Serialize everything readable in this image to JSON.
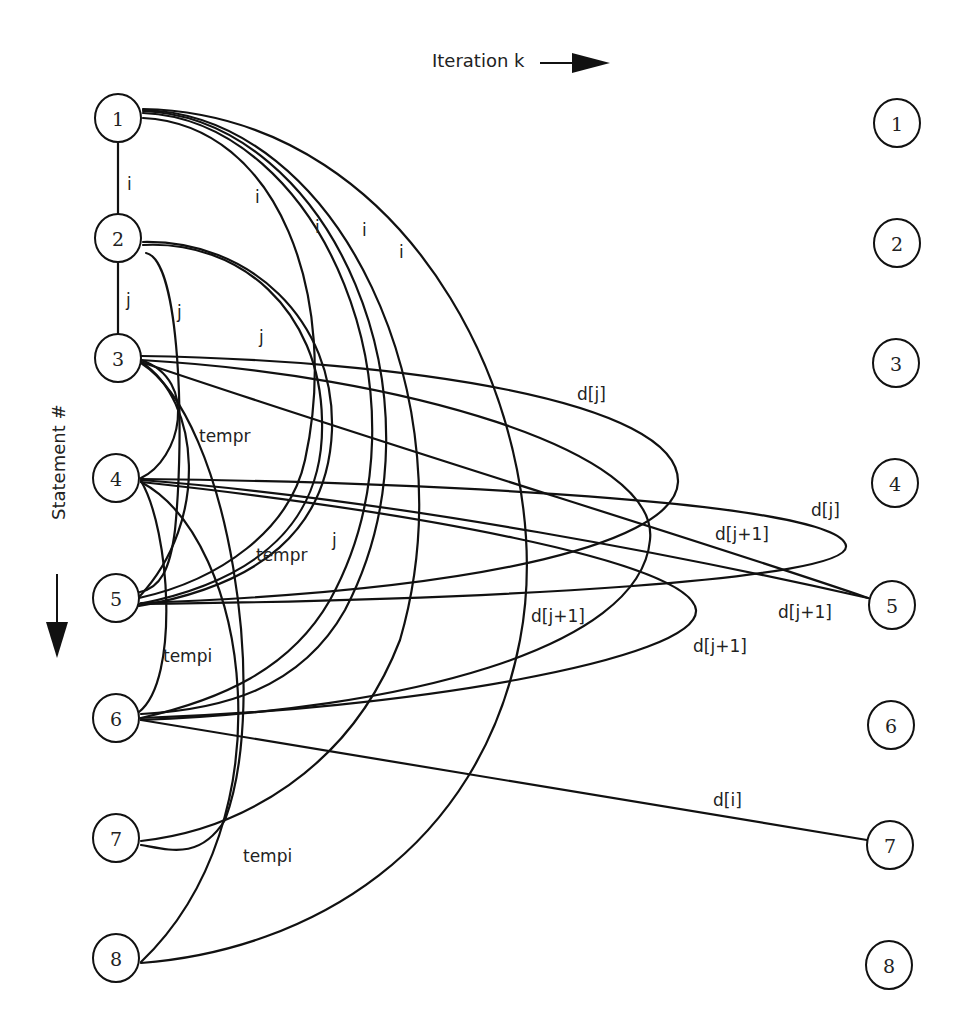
{
  "diagram": {
    "type": "dependence-graph",
    "x_axis": {
      "label": "Iteration k",
      "arrow": "arrow-right-icon"
    },
    "y_axis": {
      "label": "Statement #",
      "arrow": "arrow-down-icon"
    },
    "left_nodes": [
      {
        "id": "L1",
        "label": "1",
        "x": 118,
        "y": 118
      },
      {
        "id": "L2",
        "label": "2",
        "x": 118,
        "y": 238
      },
      {
        "id": "L3",
        "label": "3",
        "x": 118,
        "y": 358
      },
      {
        "id": "L4",
        "label": "4",
        "x": 116,
        "y": 478
      },
      {
        "id": "L5",
        "label": "5",
        "x": 116,
        "y": 598
      },
      {
        "id": "L6",
        "label": "6",
        "x": 116,
        "y": 718
      },
      {
        "id": "L7",
        "label": "7",
        "x": 116,
        "y": 838
      },
      {
        "id": "L8",
        "label": "8",
        "x": 116,
        "y": 958
      }
    ],
    "right_nodes": [
      {
        "id": "R1",
        "label": "1",
        "x": 897,
        "y": 123
      },
      {
        "id": "R2",
        "label": "2",
        "x": 897,
        "y": 243
      },
      {
        "id": "R3",
        "label": "3",
        "x": 896,
        "y": 363
      },
      {
        "id": "R4",
        "label": "4",
        "x": 895,
        "y": 483
      },
      {
        "id": "R5",
        "label": "5",
        "x": 892,
        "y": 605
      },
      {
        "id": "R6",
        "label": "6",
        "x": 891,
        "y": 725
      },
      {
        "id": "R7",
        "label": "7",
        "x": 890,
        "y": 845
      },
      {
        "id": "R8",
        "label": "8",
        "x": 889,
        "y": 965
      }
    ],
    "edge_labels": [
      {
        "text": "i",
        "x": 127,
        "y": 190
      },
      {
        "text": "i",
        "x": 255,
        "y": 203
      },
      {
        "text": "i",
        "x": 315,
        "y": 233
      },
      {
        "text": "i",
        "x": 362,
        "y": 236
      },
      {
        "text": "i",
        "x": 399,
        "y": 258
      },
      {
        "text": "j",
        "x": 126,
        "y": 306
      },
      {
        "text": "j",
        "x": 177,
        "y": 318
      },
      {
        "text": "j",
        "x": 259,
        "y": 343
      },
      {
        "text": "tempr",
        "x": 199,
        "y": 442
      },
      {
        "text": "tempr",
        "x": 256,
        "y": 561
      },
      {
        "text": "j",
        "x": 332,
        "y": 546
      },
      {
        "text": "tempi",
        "x": 163,
        "y": 662
      },
      {
        "text": "tempi",
        "x": 243,
        "y": 862
      },
      {
        "text": "d[j]",
        "x": 577,
        "y": 400
      },
      {
        "text": "d[j]",
        "x": 811,
        "y": 516
      },
      {
        "text": "d[j+1]",
        "x": 715,
        "y": 540
      },
      {
        "text": "d[j+1]",
        "x": 531,
        "y": 622
      },
      {
        "text": "d[j+1]",
        "x": 778,
        "y": 618
      },
      {
        "text": "d[j+1]",
        "x": 693,
        "y": 652
      },
      {
        "text": "d[i]",
        "x": 713,
        "y": 806
      }
    ],
    "edges": [
      {
        "from": "L1",
        "to": "L2",
        "label": "i",
        "d": "M118 141 L118 215"
      },
      {
        "from": "L2",
        "to": "L3",
        "label": "j",
        "d": "M118 261 L118 335"
      },
      {
        "from": "L1",
        "to": "L5",
        "label": "i",
        "d": "M143 118 C 280 125, 340 300, 305 460 C 290 530, 220 580, 139 598"
      },
      {
        "from": "L1",
        "to": "L6",
        "label": "i",
        "d": "M143 113 C 320 120, 440 400, 330 600 C 290 670, 220 700, 141 718"
      },
      {
        "from": "L1",
        "to": "L6b",
        "label": "i",
        "d": "M143 111 C 330 118, 455 400, 345 610 C 300 690, 220 710, 141 714"
      },
      {
        "from": "L1",
        "to": "L7",
        "label": "i",
        "d": "M143 110 C 340 115, 470 400, 400 640 C 350 770, 240 830, 141 841"
      },
      {
        "from": "L1",
        "to": "L8",
        "label": "i",
        "d": "M143 109 C 420 115, 560 430, 520 640 C 480 850, 310 950, 141 963"
      },
      {
        "from": "L2",
        "to": "L5",
        "label": "j",
        "d": "M143 245 C 240 240, 320 310, 322 420 C 325 520, 260 580, 139 604"
      },
      {
        "from": "L2",
        "to": "L5b",
        "label": "j",
        "d": "M143 242 C 250 240, 335 320, 332 430 C 328 530, 260 585, 139 606"
      },
      {
        "from": "L2",
        "to": "L5c",
        "label": "j",
        "d": "M146 253 C 180 260, 185 430, 175 530 C 170 570, 160 588, 140 592"
      },
      {
        "from": "L3",
        "to": "L4",
        "label": "tempr",
        "d": "M141 360 C 200 380, 180 460, 141 478"
      },
      {
        "from": "L3",
        "to": "L5",
        "label": "tempr",
        "d": "M141 362 C 200 400, 210 520, 140 596"
      },
      {
        "from": "L3",
        "to": "L7",
        "label": "tempr",
        "d": "M141 363 C 230 420, 270 700, 225 820 C 200 860, 170 850, 141 845"
      },
      {
        "from": "L3",
        "to": "R5",
        "label": "d[j+1]",
        "d": "M141 362 C 400 450, 700 540, 868 598"
      },
      {
        "from": "L3",
        "to": "R4loop",
        "label": "d[j]",
        "d": "M141 356 C 400 360, 680 400, 678 482 C 676 540, 500 590, 141 603"
      },
      {
        "from": "L3",
        "to": "R4loop2",
        "label": "d[j]",
        "d": "M141 360 C 400 375, 660 450, 650 540 C 640 650, 400 710, 141 720"
      },
      {
        "from": "L4",
        "to": "R5",
        "label": "d[j+1]",
        "d": "M141 480 C 400 500, 700 560, 868 598"
      },
      {
        "from": "L4",
        "to": "R5b",
        "label": "d[j]",
        "d": "M141 479 C 400 482, 840 500, 846 546 C 850 580, 500 600, 141 604"
      },
      {
        "from": "L4",
        "to": "L6",
        "label": "tempi",
        "d": "M141 481 C 170 530, 180 680, 139 712"
      },
      {
        "from": "L4",
        "to": "L8",
        "label": "tempi",
        "d": "M141 482 C 250 540, 290 820, 141 962"
      },
      {
        "from": "L4",
        "to": "R6loop",
        "label": "d[j+1]",
        "d": "M141 482 C 400 510, 690 560, 696 610 C 700 660, 400 710, 141 718"
      },
      {
        "from": "L6",
        "to": "R7",
        "label": "d[i]",
        "d": "M141 720 L867 840"
      }
    ]
  }
}
